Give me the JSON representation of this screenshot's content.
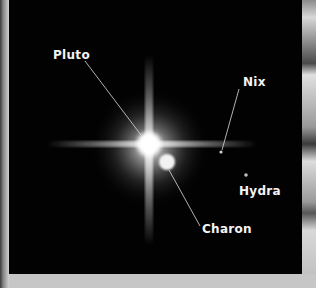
{
  "image": {
    "subject": "Pluto system telescope image",
    "labels": {
      "pluto": "Pluto",
      "charon": "Charon",
      "nix": "Nix",
      "hydra": "Hydra"
    }
  }
}
